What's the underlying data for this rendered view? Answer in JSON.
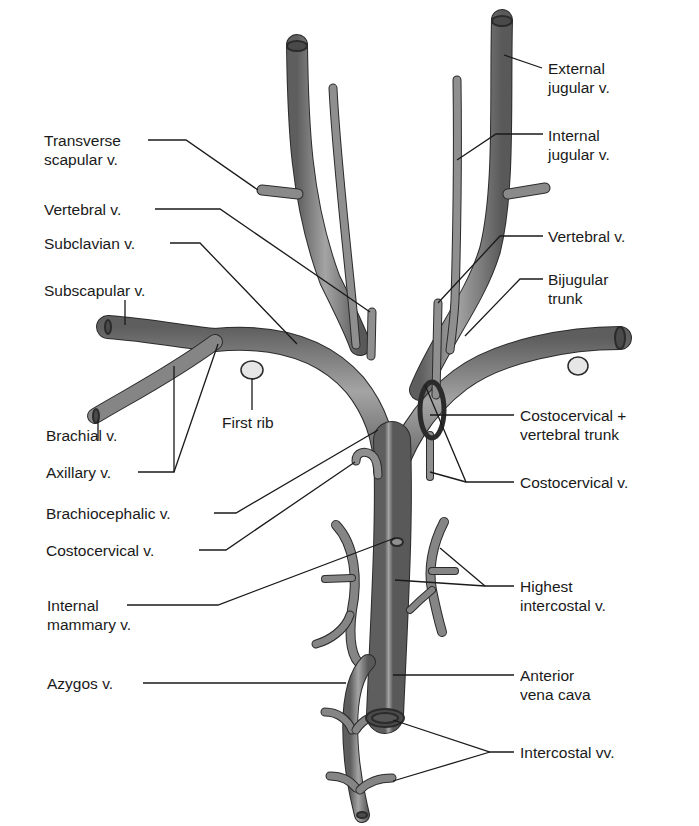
{
  "diagram": {
    "colors": {
      "vessel_fill": "#7a7a7a",
      "vessel_highlight": "#a8a8a8",
      "vessel_outline": "#2b2b2b",
      "rib_fill": "#e6e6e6",
      "leader_line": "#1a1a1a",
      "text": "#1a1a1a",
      "background": "#ffffff"
    },
    "labels_left": [
      {
        "id": "transverse-scapular",
        "text": "Transverse\nscapular v."
      },
      {
        "id": "vertebral-left",
        "text": "Vertebral v."
      },
      {
        "id": "subclavian",
        "text": "Subclavian v."
      },
      {
        "id": "subscapular",
        "text": "Subscapular v."
      },
      {
        "id": "brachial",
        "text": "Brachial v."
      },
      {
        "id": "axillary",
        "text": "Axillary v."
      },
      {
        "id": "brachiocephalic",
        "text": "Brachiocephalic v."
      },
      {
        "id": "costocervical-left",
        "text": "Costocervical v."
      },
      {
        "id": "internal-mammary",
        "text": "Internal\nmammary v."
      },
      {
        "id": "azygos",
        "text": "Azygos v."
      }
    ],
    "labels_right": [
      {
        "id": "external-jugular",
        "text": "External\njugular v."
      },
      {
        "id": "internal-jugular",
        "text": "Internal\njugular v."
      },
      {
        "id": "vertebral-right",
        "text": "Vertebral v."
      },
      {
        "id": "bijugular-trunk",
        "text": "Bijugular\ntrunk"
      },
      {
        "id": "costocervical-vertebral-trunk",
        "text": "Costocervical +\nvertebral trunk"
      },
      {
        "id": "costocervical-right",
        "text": "Costocervical v."
      },
      {
        "id": "highest-intercostal",
        "text": "Highest\nintercostal v."
      },
      {
        "id": "anterior-vena-cava",
        "text": "Anterior\nvena cava"
      },
      {
        "id": "intercostal-vv",
        "text": "Intercostal vv."
      }
    ],
    "labels_center": [
      {
        "id": "first-rib",
        "text": "First rib"
      }
    ]
  }
}
